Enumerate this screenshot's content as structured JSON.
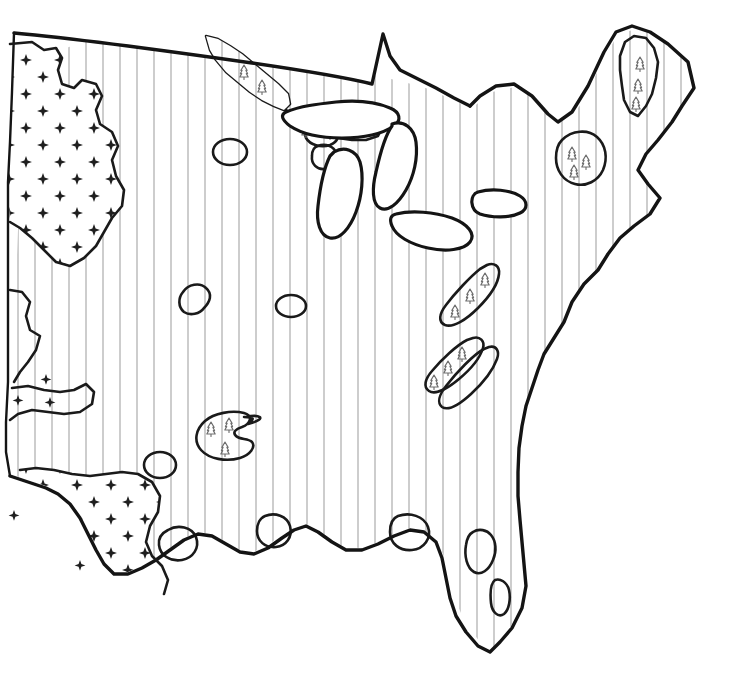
{
  "document": {
    "title": "Eastern United States Vegetation Map",
    "type": "thematic-map",
    "region": "Eastern United States",
    "background_color": "#ffffff",
    "width": 742,
    "height": 676
  },
  "styles": {
    "outline_color": "#141414",
    "hatch_color": "#a9a9a9",
    "dot_color": "#1f1f1f",
    "tree_glyph_color": "#6e6e6e",
    "lake_fill": "#ffffff"
  },
  "legend_patterns": [
    {
      "id": "vertical-hatch",
      "name": "vertical-line-hatch",
      "description": "Closely spaced vertical rule lines",
      "color": "#a9a9a9",
      "spacing_px": 17
    },
    {
      "id": "diamond-dots",
      "name": "scattered-diamond-symbols",
      "description": "Sparse four-point diamond/star marks",
      "color": "#1f1f1f",
      "spacing_px": 34
    },
    {
      "id": "conifer-trees",
      "name": "conifer-tree-symbols",
      "description": "Small fir/conifer tree glyphs",
      "color": "#6e6e6e"
    },
    {
      "id": "blank",
      "name": "unfilled-white",
      "description": "No pattern, plain white area",
      "color": "#ffffff"
    }
  ],
  "map_features": {
    "outer_boundary_name": "eastern-united-states-coastline",
    "northern_border_name": "canada-border",
    "great_lakes": [
      "lake-superior",
      "lake-michigan",
      "lake-huron",
      "lake-erie",
      "lake-ontario"
    ],
    "hatched_region_name": "deciduous-forest-zone",
    "dotted_region_names": [
      "northern-plains-grassland",
      "southern-plains-grassland"
    ],
    "conifer_region_names": [
      "northern-minnesota-conifer",
      "upper-peninsula-conifer",
      "maine-conifer",
      "adirondack-conifer",
      "appalachian-ridge-north",
      "appalachian-ridge-mid",
      "ozark-highland-conifer"
    ],
    "blank_inclusion_count": 9
  }
}
